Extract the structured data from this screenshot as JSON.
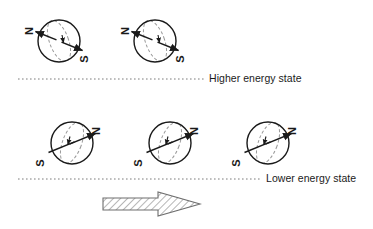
{
  "diagram": {
    "type": "physics-diagram",
    "background_color": "#ffffff",
    "stroke_color": "#1a1a1a",
    "dashed_color": "#8c8c8c",
    "labels": {
      "higher_energy": "Higher energy state",
      "lower_energy": "Lower energy state",
      "north_pole": "N",
      "south_pole": "S"
    },
    "rows": [
      {
        "name": "higher-energy-row",
        "energy_label": "Higher energy state",
        "pole_top_label": "N",
        "pole_bottom_label": "S",
        "axis_orientation": "N upper-left, S lower-right",
        "spin_arrow_direction": "down-right",
        "count": 2,
        "spheres": [
          {
            "id": "sphere-high-1",
            "cx": 59,
            "cy": 41,
            "r": 21
          },
          {
            "id": "sphere-high-2",
            "cx": 155,
            "cy": 41,
            "r": 21
          }
        ]
      },
      {
        "name": "lower-energy-row",
        "energy_label": "Lower energy state",
        "pole_top_label": "N",
        "pole_bottom_label": "S",
        "axis_orientation": "N upper-right, S lower-left",
        "spin_arrow_direction": "down-left",
        "count": 3,
        "spheres": [
          {
            "id": "sphere-low-1",
            "cx": 72,
            "cy": 143,
            "r": 21
          },
          {
            "id": "sphere-low-2",
            "cx": 170,
            "cy": 143,
            "r": 21
          },
          {
            "id": "sphere-low-3",
            "cx": 268,
            "cy": 143,
            "r": 21
          }
        ]
      }
    ],
    "dividers": [
      {
        "id": "divider-higher",
        "x1": 18,
        "x2": 205,
        "y": 79,
        "style": "dotted"
      },
      {
        "id": "divider-lower",
        "x1": 18,
        "x2": 262,
        "y": 179,
        "style": "dotted"
      }
    ],
    "field_arrow": {
      "id": "magnetic-field-arrow",
      "direction": "right",
      "fill": "hatched",
      "x_start": 103,
      "x_end": 200,
      "y_center": 204
    }
  }
}
